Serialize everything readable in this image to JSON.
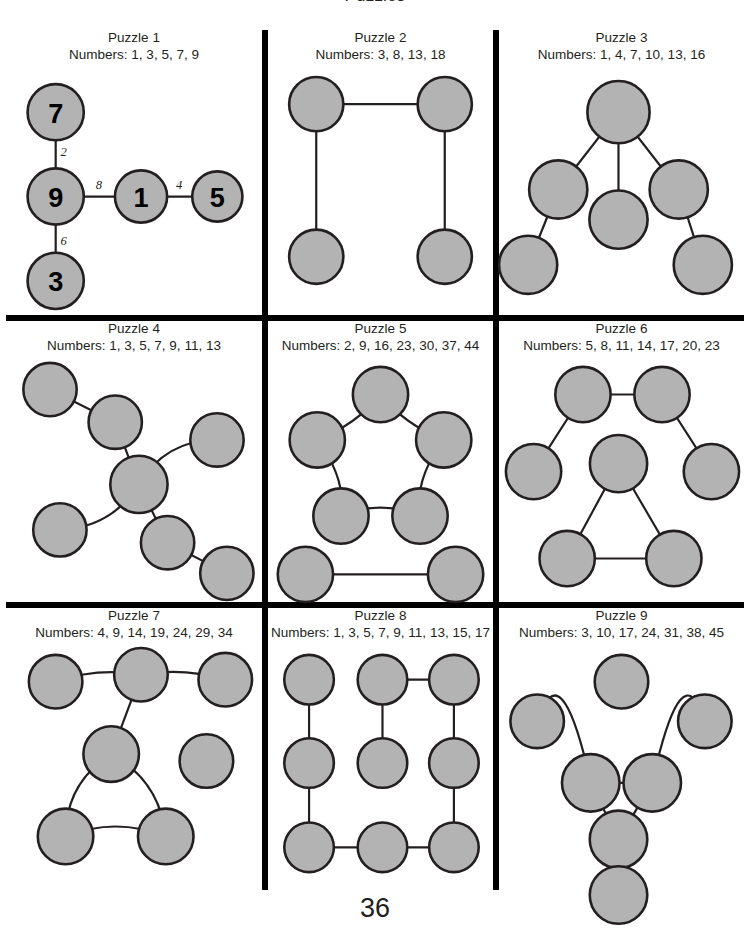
{
  "page": {
    "number": "36",
    "header_partial": "Puzzles",
    "node_fill": "#b3b3b3",
    "node_stroke": "#231f20",
    "edge_color": "#231f20",
    "divider_color": "#000000",
    "background": "#ffffff"
  },
  "puzzles": [
    {
      "id": "puzzle-1",
      "title": "Puzzle 1",
      "numbers_label": "Numbers: 1, 3, 5, 7, 9",
      "numbers": [
        1,
        3,
        5,
        7,
        9
      ],
      "viewbox": "0 0 240 250",
      "solved": true,
      "nodes": [
        {
          "id": "n1",
          "cx": 42,
          "cy": 48,
          "r": 28,
          "label": "7"
        },
        {
          "id": "n2",
          "cx": 42,
          "cy": 132,
          "r": 28,
          "label": "9"
        },
        {
          "id": "n3",
          "cx": 42,
          "cy": 216,
          "r": 28,
          "label": "3"
        },
        {
          "id": "n4",
          "cx": 127,
          "cy": 132,
          "r": 26,
          "label": "1"
        },
        {
          "id": "n5",
          "cx": 203,
          "cy": 132,
          "r": 25,
          "label": "5"
        }
      ],
      "edges": [
        {
          "from": "n1",
          "to": "n2",
          "label": "2",
          "lx": 50,
          "ly": 88
        },
        {
          "from": "n2",
          "to": "n3",
          "label": "6",
          "lx": 50,
          "ly": 176
        },
        {
          "from": "n2",
          "to": "n4",
          "label": "8",
          "lx": 85,
          "ly": 121
        },
        {
          "from": "n4",
          "to": "n5",
          "label": "4",
          "lx": 165,
          "ly": 121
        }
      ]
    },
    {
      "id": "puzzle-2",
      "title": "Puzzle 2",
      "numbers_label": "Numbers: 3, 8, 13, 18",
      "numbers": [
        3,
        8,
        13,
        18
      ],
      "viewbox": "0 0 216 250",
      "solved": false,
      "nodes": [
        {
          "id": "n1",
          "cx": 44,
          "cy": 40,
          "r": 27,
          "label": ""
        },
        {
          "id": "n2",
          "cx": 172,
          "cy": 40,
          "r": 27,
          "label": ""
        },
        {
          "id": "n3",
          "cx": 44,
          "cy": 192,
          "r": 27,
          "label": ""
        },
        {
          "id": "n4",
          "cx": 172,
          "cy": 192,
          "r": 27,
          "label": ""
        }
      ],
      "edges": [
        {
          "from": "n1",
          "to": "n2",
          "label": "",
          "lx": 0,
          "ly": 0
        },
        {
          "from": "n1",
          "to": "n3",
          "label": "",
          "lx": 0,
          "ly": 0
        },
        {
          "from": "n2",
          "to": "n4",
          "label": "",
          "lx": 0,
          "ly": 0
        }
      ]
    },
    {
      "id": "puzzle-3",
      "title": "Puzzle 3",
      "numbers_label": "Numbers: 1, 4, 7, 10, 13, 16",
      "numbers": [
        1,
        4,
        7,
        10,
        13,
        16
      ],
      "viewbox": "0 0 230 250",
      "solved": false,
      "nodes": [
        {
          "id": "n1",
          "cx": 112,
          "cy": 48,
          "r": 31,
          "label": ""
        },
        {
          "id": "n2",
          "cx": 52,
          "cy": 125,
          "r": 29,
          "label": ""
        },
        {
          "id": "n3",
          "cx": 112,
          "cy": 155,
          "r": 29,
          "label": ""
        },
        {
          "id": "n4",
          "cx": 172,
          "cy": 125,
          "r": 29,
          "label": ""
        },
        {
          "id": "n5",
          "cx": 22,
          "cy": 200,
          "r": 29,
          "label": ""
        },
        {
          "id": "n6",
          "cx": 196,
          "cy": 200,
          "r": 29,
          "label": ""
        }
      ],
      "edges": [
        {
          "from": "n1",
          "to": "n2",
          "label": "",
          "lx": 0,
          "ly": 0
        },
        {
          "from": "n1",
          "to": "n3",
          "label": "",
          "lx": 0,
          "ly": 0
        },
        {
          "from": "n1",
          "to": "n4",
          "label": "",
          "lx": 0,
          "ly": 0
        },
        {
          "from": "n2",
          "to": "n5",
          "label": "",
          "lx": 0,
          "ly": 0
        },
        {
          "from": "n4",
          "to": "n6",
          "label": "",
          "lx": 0,
          "ly": 0
        }
      ]
    },
    {
      "id": "puzzle-4",
      "title": "Puzzle 4",
      "numbers_label": "Numbers: 1, 3, 5, 7, 9, 11, 13",
      "numbers": [
        1,
        3,
        5,
        7,
        9,
        11,
        13
      ],
      "viewbox": "0 0 246 250",
      "solved": false,
      "nodes": [
        {
          "id": "n1",
          "cx": 38,
          "cy": 35,
          "r": 27,
          "label": ""
        },
        {
          "id": "n2",
          "cx": 104,
          "cy": 68,
          "r": 27,
          "label": ""
        },
        {
          "id": "n3",
          "cx": 207,
          "cy": 86,
          "r": 27,
          "label": ""
        },
        {
          "id": "n4",
          "cx": 128,
          "cy": 131,
          "r": 29,
          "label": ""
        },
        {
          "id": "n5",
          "cx": 48,
          "cy": 177,
          "r": 27,
          "label": ""
        },
        {
          "id": "n6",
          "cx": 157,
          "cy": 190,
          "r": 27,
          "label": ""
        },
        {
          "id": "n7",
          "cx": 217,
          "cy": 221,
          "r": 27,
          "label": ""
        }
      ],
      "edges": [
        {
          "from": "n1",
          "to": "n2",
          "label": "",
          "lx": 0,
          "ly": 0
        },
        {
          "from": "n2",
          "to": "n4",
          "label": "",
          "lx": 0,
          "ly": 0
        },
        {
          "from": "n4",
          "to": "n3",
          "label": "",
          "lx": 0,
          "ly": 0,
          "curve": -26
        },
        {
          "from": "n4",
          "to": "n5",
          "label": "",
          "lx": 0,
          "ly": 0,
          "curve": -24
        },
        {
          "from": "n4",
          "to": "n6",
          "label": "",
          "lx": 0,
          "ly": 0
        },
        {
          "from": "n6",
          "to": "n7",
          "label": "",
          "lx": 0,
          "ly": 0
        }
      ]
    },
    {
      "id": "puzzle-5",
      "title": "Puzzle 5",
      "numbers_label": "Numbers: 2, 9, 16, 23, 30, 37, 44",
      "numbers": [
        2,
        9,
        16,
        23,
        30,
        37,
        44
      ],
      "viewbox": "0 0 216 250",
      "solved": false,
      "nodes": [
        {
          "id": "n1",
          "cx": 108,
          "cy": 40,
          "r": 28,
          "label": ""
        },
        {
          "id": "n2",
          "cx": 44,
          "cy": 86,
          "r": 28,
          "label": ""
        },
        {
          "id": "n3",
          "cx": 172,
          "cy": 86,
          "r": 28,
          "label": ""
        },
        {
          "id": "n4",
          "cx": 68,
          "cy": 163,
          "r": 28,
          "label": ""
        },
        {
          "id": "n5",
          "cx": 148,
          "cy": 163,
          "r": 28,
          "label": ""
        },
        {
          "id": "n6",
          "cx": 32,
          "cy": 222,
          "r": 28,
          "label": ""
        },
        {
          "id": "n7",
          "cx": 184,
          "cy": 222,
          "r": 28,
          "label": ""
        }
      ],
      "edges": [
        {
          "from": "n1",
          "to": "n2",
          "label": "",
          "lx": 0,
          "ly": 0,
          "bend": [
            84,
            70
          ]
        },
        {
          "from": "n1",
          "to": "n3",
          "label": "",
          "lx": 0,
          "ly": 0,
          "bend": [
            132,
            70
          ]
        },
        {
          "from": "n2",
          "to": "n4",
          "label": "",
          "lx": 0,
          "ly": 0,
          "bend": [
            74,
            126
          ]
        },
        {
          "from": "n3",
          "to": "n5",
          "label": "",
          "lx": 0,
          "ly": 0,
          "bend": [
            142,
            126
          ]
        },
        {
          "from": "n4",
          "to": "n5",
          "label": "",
          "lx": 0,
          "ly": 0,
          "bend": [
            108,
            146
          ]
        },
        {
          "from": "n6",
          "to": "n7",
          "label": "",
          "lx": 0,
          "ly": 0
        }
      ]
    },
    {
      "id": "puzzle-6",
      "title": "Puzzle 6",
      "numbers_label": "Numbers: 5, 8, 11, 14, 17, 20, 23",
      "numbers": [
        5,
        8,
        11,
        14,
        17,
        20,
        23
      ],
      "viewbox": "0 0 230 250",
      "solved": false,
      "nodes": [
        {
          "id": "n1",
          "cx": 76,
          "cy": 40,
          "r": 28,
          "label": ""
        },
        {
          "id": "n2",
          "cx": 156,
          "cy": 40,
          "r": 28,
          "label": ""
        },
        {
          "id": "n3",
          "cx": 26,
          "cy": 118,
          "r": 28,
          "label": ""
        },
        {
          "id": "n4",
          "cx": 112,
          "cy": 110,
          "r": 29,
          "label": ""
        },
        {
          "id": "n5",
          "cx": 206,
          "cy": 118,
          "r": 28,
          "label": ""
        },
        {
          "id": "n6",
          "cx": 60,
          "cy": 206,
          "r": 28,
          "label": ""
        },
        {
          "id": "n7",
          "cx": 168,
          "cy": 206,
          "r": 28,
          "label": ""
        }
      ],
      "edges": [
        {
          "from": "n1",
          "to": "n2",
          "label": "",
          "lx": 0,
          "ly": 0
        },
        {
          "from": "n1",
          "to": "n3",
          "label": "",
          "lx": 0,
          "ly": 0
        },
        {
          "from": "n2",
          "to": "n5",
          "label": "",
          "lx": 0,
          "ly": 0
        },
        {
          "from": "n4",
          "to": "n6",
          "label": "",
          "lx": 0,
          "ly": 0
        },
        {
          "from": "n4",
          "to": "n7",
          "label": "",
          "lx": 0,
          "ly": 0
        },
        {
          "from": "n6",
          "to": "n7",
          "label": "",
          "lx": 0,
          "ly": 0
        }
      ]
    },
    {
      "id": "puzzle-7",
      "title": "Puzzle 7",
      "numbers_label": "Numbers: 4, 9, 14, 19, 24, 29, 34",
      "numbers": [
        4,
        9,
        14,
        19,
        24,
        29,
        34
      ],
      "viewbox": "0 0 246 250",
      "solved": false,
      "nodes": [
        {
          "id": "n1",
          "cx": 44,
          "cy": 40,
          "r": 27,
          "label": ""
        },
        {
          "id": "n2",
          "cx": 130,
          "cy": 33,
          "r": 27,
          "label": ""
        },
        {
          "id": "n3",
          "cx": 215,
          "cy": 38,
          "r": 27,
          "label": ""
        },
        {
          "id": "n4",
          "cx": 100,
          "cy": 113,
          "r": 28,
          "label": ""
        },
        {
          "id": "n5",
          "cx": 196,
          "cy": 120,
          "r": 27,
          "label": ""
        },
        {
          "id": "n6",
          "cx": 54,
          "cy": 196,
          "r": 28,
          "label": ""
        },
        {
          "id": "n7",
          "cx": 155,
          "cy": 196,
          "r": 28,
          "label": ""
        }
      ],
      "edges": [
        {
          "from": "n1",
          "to": "n2",
          "label": "",
          "lx": 0,
          "ly": 0,
          "curve": -11
        },
        {
          "from": "n2",
          "to": "n3",
          "label": "",
          "lx": 0,
          "ly": 0,
          "curve": -10
        },
        {
          "from": "n2",
          "to": "n4",
          "label": "",
          "lx": 0,
          "ly": 0
        },
        {
          "from": "n4",
          "to": "n6",
          "label": "",
          "lx": 0,
          "ly": 0,
          "curve": 26
        },
        {
          "from": "n4",
          "to": "n7",
          "label": "",
          "lx": 0,
          "ly": 0,
          "curve": -26
        },
        {
          "from": "n6",
          "to": "n7",
          "label": "",
          "lx": 0,
          "ly": 0,
          "curve": -20
        }
      ]
    },
    {
      "id": "puzzle-8",
      "title": "Puzzle 8",
      "numbers_label": "Numbers: 1, 3, 5, 7, 9, 11, 13, 15, 17",
      "numbers": [
        1,
        3,
        5,
        7,
        9,
        11,
        13,
        15,
        17
      ],
      "viewbox": "0 0 216 250",
      "solved": false,
      "nodes": [
        {
          "id": "n1",
          "cx": 36,
          "cy": 38,
          "r": 25,
          "label": ""
        },
        {
          "id": "n2",
          "cx": 110,
          "cy": 38,
          "r": 25,
          "label": ""
        },
        {
          "id": "n3",
          "cx": 182,
          "cy": 38,
          "r": 25,
          "label": ""
        },
        {
          "id": "n4",
          "cx": 36,
          "cy": 122,
          "r": 25,
          "label": ""
        },
        {
          "id": "n5",
          "cx": 110,
          "cy": 122,
          "r": 25,
          "label": ""
        },
        {
          "id": "n6",
          "cx": 182,
          "cy": 122,
          "r": 25,
          "label": ""
        },
        {
          "id": "n7",
          "cx": 36,
          "cy": 207,
          "r": 25,
          "label": ""
        },
        {
          "id": "n8",
          "cx": 110,
          "cy": 207,
          "r": 25,
          "label": ""
        },
        {
          "id": "n9",
          "cx": 182,
          "cy": 207,
          "r": 25,
          "label": ""
        }
      ],
      "edges": [
        {
          "from": "n2",
          "to": "n3",
          "label": "",
          "lx": 0,
          "ly": 0
        },
        {
          "from": "n1",
          "to": "n4",
          "label": "",
          "lx": 0,
          "ly": 0
        },
        {
          "from": "n2",
          "to": "n5",
          "label": "",
          "lx": 0,
          "ly": 0
        },
        {
          "from": "n3",
          "to": "n6",
          "label": "",
          "lx": 0,
          "ly": 0
        },
        {
          "from": "n4",
          "to": "n7",
          "label": "",
          "lx": 0,
          "ly": 0
        },
        {
          "from": "n6",
          "to": "n9",
          "label": "",
          "lx": 0,
          "ly": 0
        },
        {
          "from": "n7",
          "to": "n8",
          "label": "",
          "lx": 0,
          "ly": 0
        },
        {
          "from": "n8",
          "to": "n9",
          "label": "",
          "lx": 0,
          "ly": 0
        }
      ]
    },
    {
      "id": "puzzle-9",
      "title": "Puzzle 9",
      "numbers_label": "Numbers: 3, 10, 17, 24, 31, 38, 45",
      "numbers": [
        3,
        10,
        17,
        24,
        31,
        38,
        45
      ],
      "viewbox": "0 0 230 250",
      "solved": false,
      "nodes": [
        {
          "id": "n1",
          "cx": 115,
          "cy": 40,
          "r": 27,
          "label": ""
        },
        {
          "id": "n2",
          "cx": 30,
          "cy": 80,
          "r": 27,
          "label": ""
        },
        {
          "id": "n3",
          "cx": 199,
          "cy": 80,
          "r": 27,
          "label": ""
        },
        {
          "id": "n4",
          "cx": 84,
          "cy": 142,
          "r": 29,
          "label": ""
        },
        {
          "id": "n5",
          "cx": 146,
          "cy": 142,
          "r": 29,
          "label": ""
        },
        {
          "id": "n6",
          "cx": 112,
          "cy": 199,
          "r": 29,
          "label": ""
        },
        {
          "id": "n7",
          "cx": 112,
          "cy": 255,
          "r": 29,
          "label": ""
        }
      ],
      "edges": [
        {
          "from": "n2",
          "to": "n4",
          "label": "",
          "lx": 0,
          "ly": 0,
          "bend": [
            54,
            6
          ]
        },
        {
          "from": "n3",
          "to": "n5",
          "label": "",
          "lx": 0,
          "ly": 0,
          "bend": [
            176,
            6
          ]
        },
        {
          "from": "n4",
          "to": "n5",
          "label": "",
          "lx": 0,
          "ly": 0
        },
        {
          "from": "n4",
          "to": "n6",
          "label": "",
          "lx": 0,
          "ly": 0
        },
        {
          "from": "n5",
          "to": "n6",
          "label": "",
          "lx": 0,
          "ly": 0
        },
        {
          "from": "n6",
          "to": "n7",
          "label": "",
          "lx": 0,
          "ly": 0
        }
      ]
    }
  ]
}
